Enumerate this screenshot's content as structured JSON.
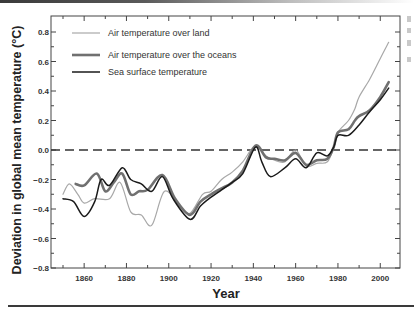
{
  "chart_data": {
    "type": "line",
    "title": "",
    "xlabel": "Year",
    "ylabel": "Deviation in global mean temperature (°C)",
    "xlim": [
      1844,
      2009
    ],
    "ylim": [
      -0.8,
      0.9
    ],
    "x_ticks": [
      1860,
      1880,
      1900,
      1920,
      1940,
      1960,
      1980,
      2000
    ],
    "x_tick_labels": [
      "1860",
      "1880",
      "1900",
      "1920",
      "1940",
      "1960",
      "1980",
      "2000"
    ],
    "y_ticks": [
      0.8,
      0.6,
      0.4,
      0.2,
      0.0,
      -0.2,
      -0.4,
      -0.6,
      -0.8
    ],
    "y_tick_labels": [
      "0.8",
      "0.6",
      "0.4",
      "0.2",
      "0.0",
      "−0.2",
      "−0.4",
      "−0.6",
      "−0.8"
    ],
    "grid": false,
    "legend_position": "upper left",
    "reference_line": {
      "y": 0.0,
      "style": "dashed",
      "color": "#333333"
    },
    "series": [
      {
        "name": "Air temperature over land",
        "color": "#a8a8a8",
        "width": 1.2,
        "x": [
          1850,
          1853,
          1857,
          1860,
          1865,
          1872,
          1877,
          1882,
          1887,
          1892,
          1898,
          1905,
          1910,
          1916,
          1920,
          1925,
          1930,
          1935,
          1940,
          1943,
          1946,
          1950,
          1955,
          1960,
          1965,
          1970,
          1975,
          1978,
          1980,
          1985,
          1988,
          1990,
          1995,
          2000,
          2004
        ],
        "values": [
          -0.3,
          -0.23,
          -0.3,
          -0.36,
          -0.33,
          -0.33,
          -0.22,
          -0.42,
          -0.44,
          -0.51,
          -0.28,
          -0.38,
          -0.43,
          -0.3,
          -0.28,
          -0.2,
          -0.15,
          -0.08,
          0.02,
          0.01,
          -0.04,
          -0.07,
          -0.08,
          0.0,
          -0.11,
          -0.09,
          -0.08,
          0.02,
          0.12,
          0.2,
          0.28,
          0.36,
          0.48,
          0.62,
          0.73
        ]
      },
      {
        "name": "Air temperature over the oceans",
        "color": "#707070",
        "width": 2.6,
        "x": [
          1856,
          1860,
          1866,
          1870,
          1874,
          1878,
          1882,
          1886,
          1890,
          1897,
          1903,
          1910,
          1915,
          1920,
          1925,
          1930,
          1935,
          1941,
          1946,
          1950,
          1955,
          1960,
          1965,
          1970,
          1975,
          1978,
          1980,
          1985,
          1988,
          1990,
          1995,
          2000,
          2004
        ],
        "values": [
          -0.23,
          -0.24,
          -0.16,
          -0.28,
          -0.22,
          -0.16,
          -0.3,
          -0.28,
          -0.27,
          -0.17,
          -0.33,
          -0.44,
          -0.35,
          -0.3,
          -0.26,
          -0.22,
          -0.14,
          0.03,
          -0.05,
          -0.06,
          -0.07,
          -0.02,
          -0.1,
          -0.07,
          -0.06,
          0.02,
          0.12,
          0.14,
          0.2,
          0.23,
          0.27,
          0.36,
          0.46
        ]
      },
      {
        "name": "Sea surface temperature",
        "color": "#1a1a1a",
        "width": 1.5,
        "x": [
          1850,
          1855,
          1860,
          1865,
          1868,
          1872,
          1878,
          1882,
          1887,
          1892,
          1897,
          1902,
          1910,
          1915,
          1920,
          1925,
          1930,
          1935,
          1941,
          1944,
          1948,
          1955,
          1960,
          1965,
          1970,
          1975,
          1978,
          1980,
          1985,
          1990,
          1995,
          2000,
          2004
        ],
        "values": [
          -0.33,
          -0.35,
          -0.45,
          -0.35,
          -0.2,
          -0.24,
          -0.12,
          -0.2,
          -0.23,
          -0.28,
          -0.18,
          -0.33,
          -0.47,
          -0.38,
          -0.32,
          -0.27,
          -0.22,
          -0.16,
          0.02,
          -0.08,
          -0.18,
          -0.12,
          -0.06,
          -0.12,
          -0.02,
          -0.04,
          0.02,
          0.1,
          0.1,
          0.17,
          0.26,
          0.34,
          0.42
        ]
      }
    ]
  },
  "legend": {
    "items": [
      {
        "label": "Air temperature over land"
      },
      {
        "label": "Air temperature over the oceans"
      },
      {
        "label": "Sea surface temperature"
      }
    ]
  },
  "axes": {
    "xlabel": "Year",
    "ylabel": "Deviation in global mean temperature (°C)"
  }
}
